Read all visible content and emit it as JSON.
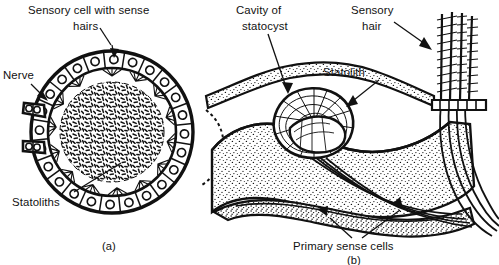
{
  "figure": {
    "background_color": "#ffffff",
    "ink_color": "#000000"
  },
  "panel_a": {
    "caption": "(a)",
    "labels": {
      "sensory_cell_line1": "Sensory cell with sense",
      "sensory_cell_line2": "hairs",
      "nerve": "Nerve",
      "statoliths": "Statoliths"
    }
  },
  "panel_b": {
    "caption": "(b)",
    "labels": {
      "cavity_line1": "Cavity of",
      "cavity_line2": "statocyst",
      "sensory_hair_line1": "Sensory",
      "sensory_hair_line2": "hair",
      "statolith": "Statolith",
      "primary_sense_cells": "Primary sense cells"
    }
  }
}
